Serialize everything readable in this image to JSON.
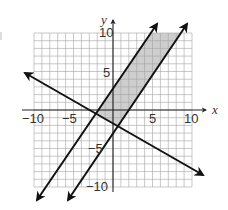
{
  "chart_data": {
    "type": "line",
    "title": "",
    "xlabel": "x",
    "ylabel": "y",
    "xlim": [
      -10,
      10
    ],
    "ylim": [
      -10,
      10
    ],
    "grid": true,
    "x_tick_labels": [
      "-10",
      "-5",
      "5",
      "10"
    ],
    "y_tick_labels": [
      "10",
      "5",
      "-5",
      "-10"
    ],
    "series": [
      {
        "name": "boundary line 1 (steep, left)",
        "slope": 1.5,
        "intercept": 3,
        "points": [
          [
            -10,
            -12
          ],
          [
            5,
            10.5
          ]
        ]
      },
      {
        "name": "boundary line 2 (steep, right)",
        "slope": 1.5,
        "intercept": -2.5,
        "points": [
          [
            -6,
            -12
          ],
          [
            9,
            11
          ]
        ]
      },
      {
        "name": "boundary line 3 (decreasing)",
        "slope": -0.6,
        "intercept": -1.3,
        "points": [
          [
            -11,
            5
          ],
          [
            11,
            -8
          ]
        ]
      }
    ],
    "shaded_region": {
      "description": "Region between the two parallel steep lines and above the decreasing line",
      "vertices": [
        [
          -2.2,
          -0.5
        ],
        [
          0.6,
          -2
        ],
        [
          8.7,
          10
        ],
        [
          4.8,
          10
        ]
      ],
      "color": "#c8c8c8"
    },
    "legend": null
  },
  "labels": {
    "x_axis": "x",
    "y_axis": "y",
    "x_ticks": {
      "neg10": "−10",
      "neg5": "−5",
      "pos5": "5",
      "pos10": "10"
    },
    "y_ticks": {
      "pos10": "10",
      "pos5": "5",
      "neg5": "−5",
      "neg10": "−10"
    }
  },
  "colors": {
    "grid": "#9a9a9a",
    "axis": "#222222",
    "line": "#111111",
    "shade": "#c8c8c8"
  }
}
